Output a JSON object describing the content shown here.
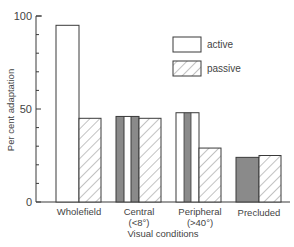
{
  "chart_data": {
    "type": "bar",
    "title": "",
    "xlabel": "Visual conditions",
    "ylabel": "Per cent adaptation",
    "ylim": [
      0,
      100
    ],
    "yticks_labeled": [
      0,
      50,
      100
    ],
    "yticks_minor_step": 10,
    "grid": false,
    "legend_position": "upper right",
    "categories": [
      {
        "line1": "Wholefield",
        "line2": ""
      },
      {
        "line1": "Central",
        "line2": "(<8°)"
      },
      {
        "line1": "Peripheral",
        "line2": "(>40°)"
      },
      {
        "line1": "Precluded",
        "line2": ""
      }
    ],
    "series": [
      {
        "name": "active",
        "values": [
          95,
          46,
          48,
          24
        ],
        "fill": "white"
      },
      {
        "name": "passive",
        "values": [
          45,
          45,
          29,
          25
        ],
        "fill": "hatched"
      }
    ]
  },
  "legend": {
    "active_label": "active",
    "passive_label": "passive"
  },
  "axis": {
    "y_tick_0": "0",
    "y_tick_50": "50",
    "y_tick_100": "100"
  },
  "colors": {
    "outline": "#3a3a3a",
    "grey_fill": "#8a8a8a",
    "hatch": "#777777",
    "text": "#444444"
  }
}
